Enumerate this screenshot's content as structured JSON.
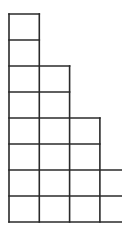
{
  "diagram": {
    "type": "young-diagram-grid",
    "line_color": "#2a2a2a",
    "line_width": 1.6,
    "background": "#ffffff",
    "origin": {
      "x": 9,
      "y": 222
    },
    "cell_width": 30.3,
    "cell_height": 26,
    "column_heights": [
      8,
      6,
      4,
      2
    ],
    "last_column_open_right": true,
    "right_edge": 122
  }
}
